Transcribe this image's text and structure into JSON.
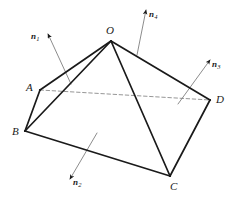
{
  "figure": {
    "type": "geometry-diagram",
    "stroke_color": "#1a1a1a",
    "dashed_color": "#8a8a8a",
    "leader_color": "#6e6e6e",
    "background_color": "#ffffff",
    "vertices": [
      {
        "name": "O",
        "label": "O",
        "x": 111,
        "y": 41,
        "label_x": 106,
        "label_y": 25
      },
      {
        "name": "A",
        "label": "A",
        "x": 40,
        "y": 90,
        "label_x": 26,
        "label_y": 82
      },
      {
        "name": "B",
        "label": "B",
        "x": 25,
        "y": 131,
        "label_x": 12,
        "label_y": 126
      },
      {
        "name": "C",
        "label": "C",
        "x": 170,
        "y": 176,
        "label_x": 170,
        "label_y": 181
      },
      {
        "name": "D",
        "label": "D",
        "x": 210,
        "y": 100,
        "label_x": 216,
        "label_y": 94
      }
    ],
    "solid_edges": [
      {
        "name": "edge-O-A",
        "from": "O",
        "to": "A"
      },
      {
        "name": "edge-O-B",
        "from": "O",
        "to": "B"
      },
      {
        "name": "edge-O-C",
        "from": "O",
        "to": "C"
      },
      {
        "name": "edge-O-D",
        "from": "O",
        "to": "D"
      },
      {
        "name": "edge-A-B",
        "from": "A",
        "to": "B"
      },
      {
        "name": "edge-B-C",
        "from": "B",
        "to": "C"
      },
      {
        "name": "edge-C-D",
        "from": "C",
        "to": "D"
      }
    ],
    "dashed_edges": [
      {
        "name": "edge-A-D",
        "from": "A",
        "to": "D"
      }
    ],
    "normals": [
      {
        "name": "n1",
        "label": "n",
        "subscript": "1",
        "tail_x": 71,
        "tail_y": 84,
        "tip_x": 48,
        "tip_y": 34,
        "label_x": 31,
        "label_y": 32
      },
      {
        "name": "n2",
        "label": "n",
        "subscript": "2",
        "tail_x": 97,
        "tail_y": 133,
        "tip_x": 70,
        "tip_y": 179,
        "label_x": 73,
        "label_y": 178
      },
      {
        "name": "n3",
        "label": "n",
        "subscript": "3",
        "tail_x": 178,
        "tail_y": 104,
        "tip_x": 210,
        "tip_y": 60,
        "label_x": 212,
        "label_y": 60
      },
      {
        "name": "n4",
        "label": "n",
        "subscript": "4",
        "tail_x": 137,
        "tail_y": 55,
        "tip_x": 146,
        "tip_y": 10,
        "label_x": 149,
        "label_y": 10
      }
    ]
  }
}
